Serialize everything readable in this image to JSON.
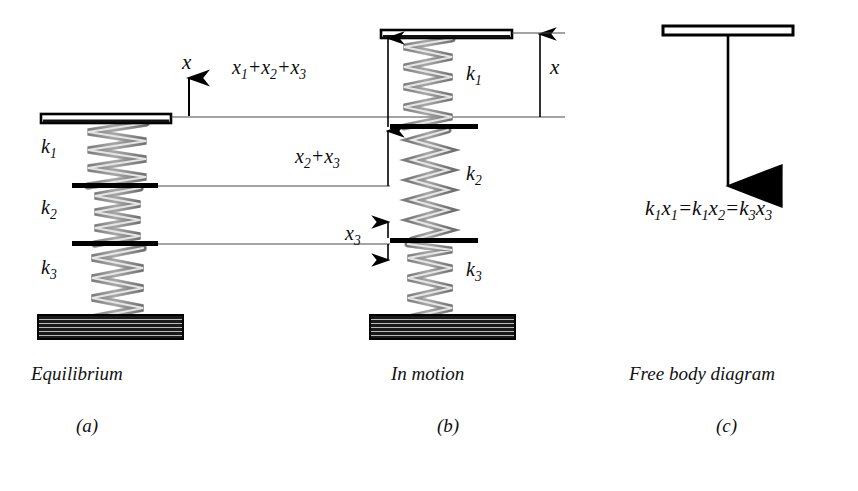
{
  "figure": {
    "background_color": "#ffffff",
    "ink_color": "#000000",
    "spring_fill_color": "#b3b3b3"
  },
  "panels": [
    {
      "id": "a",
      "caption": "Equilibrium",
      "letter": "(a)",
      "axis_label": "x",
      "springs": [
        {
          "label": "k",
          "subscript": "1"
        },
        {
          "label": "k",
          "subscript": "2"
        },
        {
          "label": "k",
          "subscript": "3"
        }
      ]
    },
    {
      "id": "b",
      "caption": "In motion",
      "letter": "(b)",
      "displacement_label": "x",
      "springs": [
        {
          "label": "k",
          "subscript": "1"
        },
        {
          "label": "k",
          "subscript": "2"
        },
        {
          "label": "k",
          "subscript": "3"
        }
      ],
      "dimensions": [
        {
          "name": "total-displacement",
          "text": "x1+x2+x3"
        },
        {
          "name": "lower-two-displacement",
          "text": "x2+x3"
        },
        {
          "name": "bottom-displacement",
          "text": "x3"
        }
      ]
    },
    {
      "id": "c",
      "caption": "Free body diagram",
      "letter": "(c)",
      "force_equation": "k1x1=k1x2=k3x3"
    }
  ],
  "labels": {
    "k1": {
      "base": "k",
      "sub": "1"
    },
    "k2": {
      "base": "k",
      "sub": "2"
    },
    "k3": {
      "base": "k",
      "sub": "3"
    },
    "x": "x",
    "x1": {
      "base": "x",
      "sub": "1"
    },
    "x2": {
      "base": "x",
      "sub": "2"
    },
    "x3": {
      "base": "x",
      "sub": "3"
    },
    "plus": "+",
    "equals": "="
  }
}
